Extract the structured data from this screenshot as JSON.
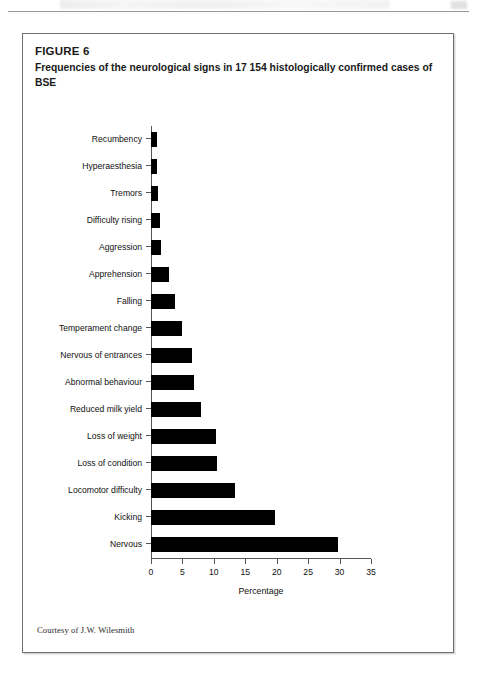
{
  "figure": {
    "label": "FIGURE 6",
    "title": "Frequencies of the neurological signs in 17 154 histologically confirmed cases of BSE",
    "credit": "Courtesy of J.W. Wilesmith"
  },
  "chart_data": {
    "type": "bar",
    "orientation": "horizontal",
    "title": "Frequencies of the neurological signs in 17 154 histologically confirmed cases of BSE",
    "xlabel": "Percentage",
    "ylabel": "",
    "xlim": [
      0,
      35
    ],
    "xticks": [
      0,
      5,
      10,
      15,
      20,
      25,
      30,
      35
    ],
    "xtick_labels": [
      "0",
      "5",
      "10",
      "15",
      "20",
      "25",
      "30",
      "35"
    ],
    "grid": false,
    "legend": false,
    "bar_color": "#000000",
    "categories": [
      "Recumbency",
      "Hyperaesthesia",
      "Tremors",
      "Difficulty rising",
      "Aggression",
      "Apprehension",
      "Falling",
      "Temperament change",
      "Nervous of entrances",
      "Abnormal behaviour",
      "Reduced milk yield",
      "Loss of weight",
      "Loss of condition",
      "Locomotor difficulty",
      "Kicking",
      "Nervous"
    ],
    "values": [
      0.9,
      1.0,
      1.1,
      1.5,
      1.6,
      2.9,
      3.8,
      5.0,
      6.6,
      6.8,
      8.0,
      10.3,
      10.5,
      13.3,
      19.7,
      29.8
    ]
  }
}
